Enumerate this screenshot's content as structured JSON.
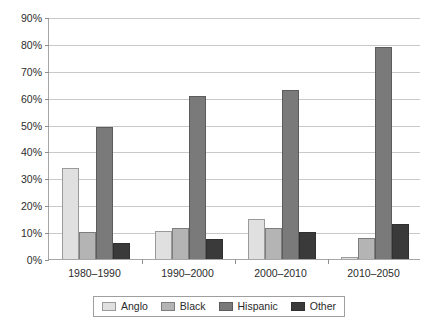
{
  "chart_data": {
    "type": "bar",
    "title": "",
    "subtitle": "",
    "xlabel": "",
    "ylabel": "",
    "categories": [
      "1980–1990",
      "1990–2000",
      "2000–2010",
      "2010–2050"
    ],
    "series": [
      {
        "name": "Anglo",
        "color": "#e0e0e0",
        "values": [
          34,
          10.5,
          15,
          0.7
        ]
      },
      {
        "name": "Black",
        "color": "#b4b4b4",
        "values": [
          10,
          11.5,
          11.5,
          8
        ]
      },
      {
        "name": "Hispanic",
        "color": "#7a7a7a",
        "values": [
          49,
          60.5,
          63,
          79
        ]
      },
      {
        "name": "Other",
        "color": "#3a3a3a",
        "values": [
          6,
          7.5,
          10,
          13
        ]
      }
    ],
    "ylim": [
      0,
      90
    ],
    "ytick_values": [
      0,
      10,
      20,
      30,
      40,
      50,
      60,
      70,
      80,
      90
    ],
    "ytick_labels": [
      "0%",
      "10%",
      "20%",
      "30%",
      "40%",
      "50%",
      "60%",
      "70%",
      "80%",
      "90%"
    ],
    "grid": true,
    "grid_axis": "y",
    "legend_position": "bottom",
    "value_suffix": "%"
  }
}
